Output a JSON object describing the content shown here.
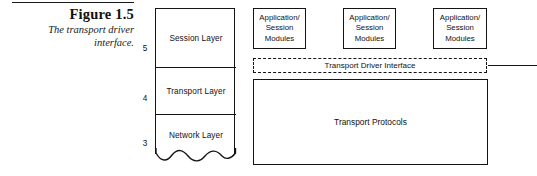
{
  "figure": {
    "number_label": "Figure 1.5",
    "caption_line_1": "The transport driver",
    "caption_line_2": "interface."
  },
  "layer_stack": {
    "layers": [
      {
        "number": "5",
        "name": "Session Layer"
      },
      {
        "number": "4",
        "name": "Transport Layer"
      },
      {
        "number": "3",
        "name": "Network Layer"
      }
    ]
  },
  "diagram": {
    "app_modules": [
      {
        "line_1": "Application/",
        "line_2": "Session",
        "line_3": "Modules"
      },
      {
        "line_1": "Application/",
        "line_2": "Session",
        "line_3": "Modules"
      },
      {
        "line_1": "Application/",
        "line_2": "Session",
        "line_3": "Modules"
      }
    ],
    "transport_driver_interface_label": "Transport Driver Interface",
    "transport_protocols_label": "Transport Protocols"
  },
  "colors": {
    "ink": "#141414",
    "page_background": "#ffffff"
  }
}
